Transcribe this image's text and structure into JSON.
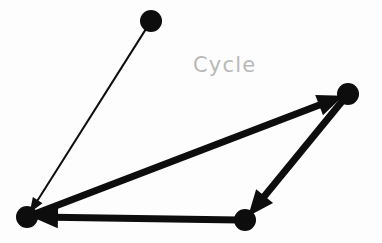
{
  "canvas": {
    "width": 382,
    "height": 243,
    "background_color": "#fdfdfd"
  },
  "diagram": {
    "kind": "directed-graph",
    "label": {
      "text": "Cycle",
      "x": 193,
      "y": 72,
      "font_size": 21,
      "color": "#b9b9b9"
    },
    "node_color": "#0d0d0d",
    "edge_color": "#0d0d0d",
    "nodes": [
      {
        "id": "n-top",
        "name": "node-top",
        "cx": 151,
        "cy": 21,
        "r": 11
      },
      {
        "id": "n-right",
        "name": "node-right",
        "cx": 348,
        "cy": 94,
        "r": 11
      },
      {
        "id": "n-bottom-left",
        "name": "node-bottom-left",
        "cx": 27,
        "cy": 217,
        "r": 11
      },
      {
        "id": "n-bottom-right",
        "name": "node-bottom-right",
        "cx": 245,
        "cy": 220,
        "r": 11
      }
    ],
    "edges": [
      {
        "id": "e-top-to-bottomleft",
        "name": "edge-top-to-bottom-left",
        "from": "n-top",
        "to": "n-bottom-left",
        "style": "thin",
        "stroke_width": 2,
        "arrow": true,
        "arrow_size": 15,
        "in_cycle": false
      },
      {
        "id": "e-bottomleft-to-right",
        "name": "edge-bottom-left-to-right",
        "from": "n-bottom-left",
        "to": "n-right",
        "style": "thick",
        "stroke_width": 7,
        "arrow": true,
        "arrow_size": 26,
        "in_cycle": true
      },
      {
        "id": "e-right-to-bottomright",
        "name": "edge-right-to-bottom-right",
        "from": "n-right",
        "to": "n-bottom-right",
        "style": "thick",
        "stroke_width": 7,
        "arrow": true,
        "arrow_size": 26,
        "in_cycle": true
      },
      {
        "id": "e-bottomright-to-bottomleft",
        "name": "edge-bottom-right-to-bottom-left",
        "from": "n-bottom-right",
        "to": "n-bottom-left",
        "style": "thick",
        "stroke_width": 7,
        "arrow": true,
        "arrow_size": 26,
        "in_cycle": true
      }
    ]
  }
}
